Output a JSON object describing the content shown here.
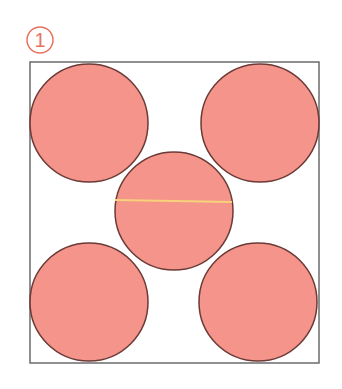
{
  "label": {
    "number": "1",
    "color": "#e8735f"
  },
  "frame": {
    "x": 30,
    "y": 62,
    "w": 289,
    "h": 301,
    "stroke": "#6b6b6b"
  },
  "circles": {
    "fill": "#f4948a",
    "stroke": "#6b3a36",
    "items": [
      {
        "cx": 89,
        "cy": 123,
        "r": 59
      },
      {
        "cx": 260,
        "cy": 123,
        "r": 59
      },
      {
        "cx": 174,
        "cy": 211,
        "r": 59
      },
      {
        "cx": 89,
        "cy": 302,
        "r": 59
      },
      {
        "cx": 258,
        "cy": 302,
        "r": 59
      }
    ]
  },
  "diameter_line": {
    "x1": 115,
    "y1": 200,
    "x2": 232,
    "y2": 202,
    "color": "#f7d27a"
  }
}
